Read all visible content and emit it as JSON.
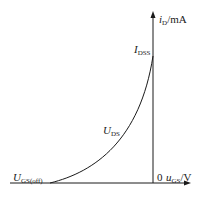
{
  "diagram": {
    "type": "transfer-characteristic",
    "y_axis": {
      "var": "i",
      "sub": "D",
      "unit": "/mA"
    },
    "x_axis": {
      "var": "u",
      "sub": "GS",
      "unit": "/V"
    },
    "origin": "0",
    "labels": {
      "idss": {
        "var": "I",
        "sub": "DSS"
      },
      "uds": {
        "var": "U",
        "sub": "DS"
      },
      "ugsoff": {
        "var": "U",
        "sub": "GS(off)"
      }
    },
    "colors": {
      "line": "#1a1a1a",
      "background": "#ffffff"
    }
  }
}
